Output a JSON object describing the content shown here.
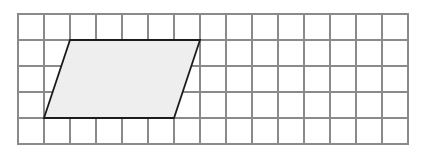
{
  "figure": {
    "type": "geometry-grid-figure",
    "canvas": {
      "width": 424,
      "height": 155,
      "background": "#ffffff"
    },
    "grid": {
      "label": "unit square grid",
      "origin_x": 18,
      "origin_y": 14,
      "cell_size": 26,
      "columns": 15,
      "rows": 5,
      "line_color": "#8a8a8a",
      "line_width": 1.2,
      "border_color": "#8a8a8a",
      "border_width": 1.4
    },
    "shapes": [
      {
        "name": "parallelogram",
        "kind": "parallelogram",
        "vertices_grid": [
          [
            2,
            1
          ],
          [
            7,
            1
          ],
          [
            6,
            4
          ],
          [
            1,
            4
          ]
        ],
        "vertices_px": [
          [
            70,
            40
          ],
          [
            200,
            40
          ],
          [
            174,
            118
          ],
          [
            44,
            118
          ]
        ],
        "base_units": 5,
        "height_units": 3,
        "slant_offset_units": 1,
        "area_units": 15,
        "fill_color": "#eeeeee",
        "stroke_color": "#1c1c1c",
        "stroke_width": 1.8
      }
    ],
    "labels": [],
    "annotations": []
  }
}
